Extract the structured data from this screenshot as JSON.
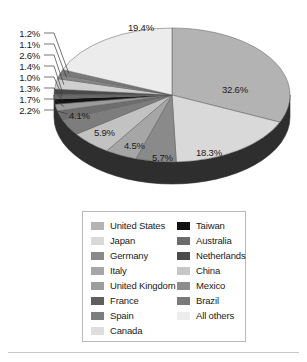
{
  "chart_data": {
    "type": "pie",
    "title": "",
    "subtitle": "",
    "xlabel": "",
    "ylabel": "",
    "legend_position": "bottom",
    "grid": false,
    "three_d": true,
    "value_suffix": "%",
    "categories": [
      "United States",
      "Japan",
      "Germany",
      "Italy",
      "United Kingdom",
      "France",
      "Spain",
      "Canada",
      "Taiwan",
      "Australia",
      "Netherlands",
      "China",
      "Mexico",
      "Brazil",
      "All others"
    ],
    "values": [
      32.6,
      18.3,
      5.7,
      4.5,
      5.9,
      4.1,
      2.2,
      1.7,
      1.3,
      1.0,
      1.4,
      2.6,
      1.1,
      1.2,
      19.4
    ],
    "labels": [
      "32.6%",
      "18.3%",
      "5.7%",
      "4.5%",
      "5.9%",
      "4.1%",
      "2.2%",
      "1.7%",
      "1.3%",
      "1.0%",
      "1.4%",
      "2.6%",
      "1.1%",
      "1.2%",
      "19.4%"
    ],
    "colors": [
      "#b3b3b3",
      "#d9d9d9",
      "#8a8a8a",
      "#a6a6a6",
      "#c2c2c2",
      "#7d7d7d",
      "#6e6e6e",
      "#9b9b9b",
      "#111111",
      "#6b6b6b",
      "#4a4a4a",
      "#cfcfcf",
      "#878787",
      "#7a7a7a",
      "#ececec"
    ],
    "slice_labels_inside": [
      {
        "text": "32.6%",
        "x": 222,
        "y": 84
      },
      {
        "text": "19.4%",
        "x": 128,
        "y": 22
      },
      {
        "text": "18.3%",
        "x": 196,
        "y": 147
      },
      {
        "text": "5.7%",
        "x": 152,
        "y": 152
      },
      {
        "text": "4.5%",
        "x": 124,
        "y": 140
      },
      {
        "text": "5.9%",
        "x": 94,
        "y": 127
      },
      {
        "text": "4.1%",
        "x": 69,
        "y": 110
      }
    ],
    "callout_labels": [
      {
        "text": "1.2%",
        "y": 28
      },
      {
        "text": "1.1%",
        "y": 39
      },
      {
        "text": "2.6%",
        "y": 50
      },
      {
        "text": "1.4%",
        "y": 61
      },
      {
        "text": "1.0%",
        "y": 72
      },
      {
        "text": "1.3%",
        "y": 83
      },
      {
        "text": "1.7%",
        "y": 94
      },
      {
        "text": "2.2%",
        "y": 105
      }
    ]
  },
  "legend": {
    "columns": [
      {
        "items": [
          {
            "label": "United States",
            "color": "#b3b3b3"
          },
          {
            "label": "Japan",
            "color": "#d9d9d9"
          },
          {
            "label": "Germany",
            "color": "#8a8a8a"
          },
          {
            "label": "Italy",
            "color": "#a6a6a6"
          },
          {
            "label": "United Kingdom",
            "color": "#9e9e9e"
          },
          {
            "label": "France",
            "color": "#5f5f5f"
          },
          {
            "label": "Spain",
            "color": "#7d7d7d"
          },
          {
            "label": "Canada",
            "color": "#dedede"
          }
        ]
      },
      {
        "items": [
          {
            "label": "Taiwan",
            "color": "#111111"
          },
          {
            "label": "Australia",
            "color": "#6b6b6b"
          },
          {
            "label": "Netherlands",
            "color": "#4a4a4a"
          },
          {
            "label": "China",
            "color": "#c7c7c7"
          },
          {
            "label": "Mexico",
            "color": "#8d8d8d"
          },
          {
            "label": "Brazil",
            "color": "#7a7a7a"
          },
          {
            "label": "All others",
            "color": "#ececec"
          }
        ]
      }
    ]
  },
  "style": {
    "background": "#ffffff",
    "side_wall_color": "#2e2e2e",
    "outline_color": "#555555",
    "legend_border": "#b8b8b8",
    "rule_color": "#c9c9c9"
  }
}
